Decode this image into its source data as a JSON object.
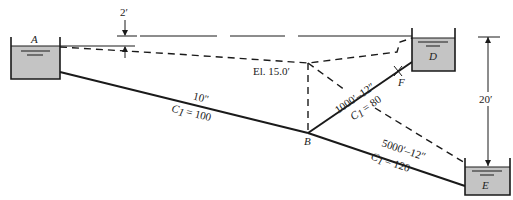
{
  "diagram": {
    "type": "pipe-network",
    "colors": {
      "water": "#c4c4c4",
      "line": "#1a1a1a",
      "background": "#ffffff"
    },
    "reservoirs": [
      {
        "id": "A",
        "label": "A"
      },
      {
        "id": "D",
        "label": "D"
      },
      {
        "id": "E",
        "label": "E"
      }
    ],
    "junctions": [
      {
        "id": "B",
        "label": "B"
      },
      {
        "id": "F",
        "label": "F"
      }
    ],
    "pipes": [
      {
        "from": "A",
        "to": "B",
        "size_label": "10\"",
        "coef_label": "= 100"
      },
      {
        "from": "B",
        "to": "D",
        "size_label": "1000′–12″",
        "coef_label": "= 80"
      },
      {
        "from": "B",
        "to": "E",
        "size_label": "5000′–12″",
        "coef_label": "= 120"
      }
    ],
    "coef_symbol": "C",
    "coef_subscript": "1",
    "annotations": {
      "head_diff": "2′",
      "elevation": "El. 15.0′",
      "d_to_e": "20′"
    }
  }
}
